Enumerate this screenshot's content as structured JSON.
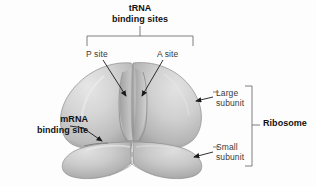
{
  "figure": {
    "background_color": "#fdfdfd",
    "label_color": "#3a3a3a",
    "bold_label_color": "#111111",
    "leader_line_color": "#6f6f6f",
    "arrow_color": "#1a1a1a"
  },
  "labels": {
    "trna_binding_sites": "tRNA\nbinding sites",
    "p_site": "P site",
    "a_site": "A site",
    "large_subunit": "Large\nsubunit",
    "small_subunit": "Small\nsubunit",
    "ribosome": "Ribosome",
    "mrna_binding_site": "mRNA\nbinding site"
  },
  "structure": {
    "large_subunit": {
      "name": "large subunit",
      "fill_light": "#dcdcdc",
      "fill_mid": "#c9c9c9",
      "fill_dark": "#a9a9a9",
      "outline": "#8f8f8f"
    },
    "small_subunit": {
      "name": "small subunit",
      "fill_light": "#d8d8d8",
      "fill_mid": "#c4c4c4",
      "fill_dark": "#a6a6a6",
      "outline": "#8f8f8f"
    },
    "grooves": [
      {
        "name": "P site groove",
        "shade": "#9a9a9a"
      },
      {
        "name": "A site groove",
        "shade": "#9a9a9a"
      }
    ]
  },
  "brackets": [
    {
      "name": "trna-bracket",
      "orientation": "horizontal-top"
    },
    {
      "name": "ribosome-bracket",
      "orientation": "vertical-right"
    }
  ],
  "pointers": [
    {
      "name": "p-site-pointer",
      "target": "P site groove"
    },
    {
      "name": "a-site-pointer",
      "target": "A site groove"
    },
    {
      "name": "large-subunit-pointer",
      "target": "large subunit"
    },
    {
      "name": "small-subunit-pointer",
      "target": "small subunit"
    },
    {
      "name": "mrna-binding-site-pointer",
      "target": "subunit interface"
    }
  ]
}
